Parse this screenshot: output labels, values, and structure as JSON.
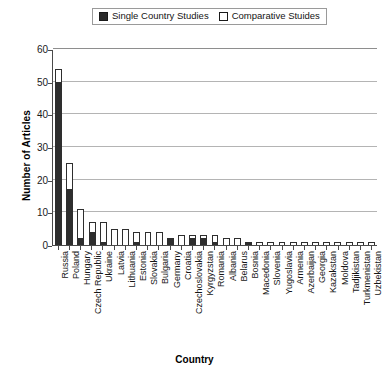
{
  "chart_data": {
    "type": "bar",
    "subtype": "stacked-bar",
    "title": "",
    "xlabel": "Country",
    "ylabel": "Number of Articles",
    "ylim": [
      0,
      60
    ],
    "ytick_step": 10,
    "yticks": [
      0,
      10,
      20,
      30,
      40,
      50,
      60
    ],
    "grid": true,
    "legend_position": "top-center",
    "categories": [
      "Russia",
      "Poland",
      "Hungary",
      "Czech Republic",
      "Ukraine",
      "Latvia",
      "Lithuania",
      "Estonia",
      "Slovakia",
      "Bulgaria",
      "Germany",
      "Croatia",
      "Czechoslovakia",
      "Kyrgyzstan",
      "Romania",
      "Albania",
      "Belarus",
      "Bosnia",
      "Macedonia",
      "Slovenia",
      "Yugoslavia",
      "Armenia",
      "Azerbaijan",
      "Georgia",
      "Kazakstan",
      "Moldova",
      "Tadjikistan",
      "Turkmenistan",
      "Uzbekistan"
    ],
    "series": [
      {
        "name": "Single Country Studies",
        "color": "#2e2e2e",
        "values": [
          50,
          17,
          2,
          4,
          1,
          0,
          0,
          1,
          0,
          0,
          2,
          0,
          2,
          2,
          1,
          0,
          0,
          1,
          0,
          0,
          0,
          0,
          0,
          0,
          0,
          0,
          0,
          0,
          0
        ]
      },
      {
        "name": "Comparative Stuides",
        "color": "#ffffff",
        "values": [
          4,
          8,
          9,
          3,
          6,
          5,
          5,
          3,
          4,
          4,
          0,
          3,
          1,
          1,
          2,
          2,
          2,
          0,
          1,
          1,
          1,
          1,
          1,
          1,
          1,
          1,
          1,
          1,
          1
        ]
      }
    ],
    "totals": [
      54,
      25,
      11,
      7,
      7,
      5,
      5,
      4,
      4,
      4,
      2,
      3,
      3,
      3,
      3,
      2,
      2,
      1,
      1,
      1,
      1,
      1,
      1,
      1,
      1,
      1,
      1,
      1,
      1
    ]
  },
  "legend": {
    "entries": [
      {
        "label": "Single Country Studies",
        "swatch": "filled-square"
      },
      {
        "label": "Comparative Stuides",
        "swatch": "hollow-square"
      }
    ]
  },
  "axes": {
    "y_title": "Number of Articles",
    "x_title": "Country",
    "y_tick_labels": [
      "60",
      "50",
      "40",
      "30",
      "20",
      "10",
      "0"
    ]
  }
}
